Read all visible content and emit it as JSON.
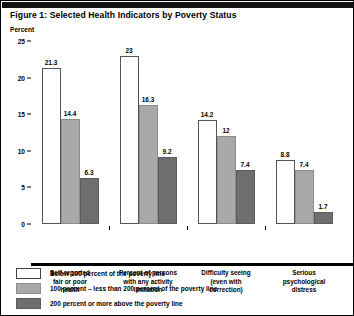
{
  "figure": {
    "title": "Figure 1: Selected Health Indicators by Poverty Status",
    "axis_unit_label": "Percent"
  },
  "colors": {
    "series_below_100": "#ffffff",
    "series_100_to_200": "#a9a9a9",
    "series_200_or_more": "#6e6e6e",
    "axis": "#000000",
    "background": "#ffffff",
    "top_rule": "#111111"
  },
  "legend": {
    "position": "bottom-left",
    "items": [
      {
        "label": "Below 100 percent of the poverty line",
        "swatch": "series_below_100"
      },
      {
        "label": "100 percent – less than 200 percent of the poverty line",
        "swatch": "series_100_to_200"
      },
      {
        "label": "200 percent or more above the poverty line",
        "swatch": "series_200_or_more"
      }
    ]
  },
  "chart_data": {
    "type": "bar",
    "title": "Figure 1: Selected Health Indicators by Poverty Status",
    "xlabel": "",
    "ylabel": "Percent",
    "ylim": [
      0,
      25
    ],
    "yticks": [
      0,
      5,
      10,
      15,
      20,
      25
    ],
    "grid": false,
    "legend_position": "bottom-left",
    "categories": [
      "Self-reported fair or poor health",
      "Percent of persons with any activity limitation",
      "Difficulty seeing (even with correction)",
      "Serious psychological distress"
    ],
    "category_lines": [
      [
        "Self-reported",
        "fair or poor",
        "health"
      ],
      [
        "Percent of persons",
        "with any activity",
        "limitation"
      ],
      [
        "Difficulty seeing",
        "(even with",
        "correction)"
      ],
      [
        "Serious",
        "psychological",
        "distress"
      ]
    ],
    "series": [
      {
        "name": "Below 100 percent of the poverty line",
        "values": [
          21.3,
          23,
          14.2,
          8.8
        ],
        "value_labels": [
          "21.3",
          "23",
          "14.2",
          "8.8"
        ]
      },
      {
        "name": "100 percent – less than 200 percent of the poverty line",
        "values": [
          14.4,
          16.3,
          12,
          7.4
        ],
        "value_labels": [
          "14.4",
          "16.3",
          "12",
          "7.4"
        ]
      },
      {
        "name": "200 percent or more above the poverty line",
        "values": [
          6.3,
          9.2,
          7.4,
          1.7
        ],
        "value_labels": [
          "6.3",
          "9.2",
          "7.4",
          "1.7"
        ]
      }
    ]
  }
}
